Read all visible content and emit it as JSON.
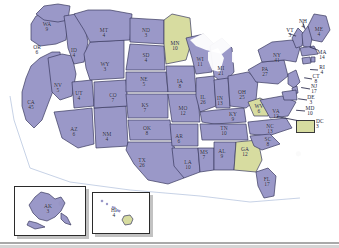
{
  "map": {
    "title": "United States Electoral Vote Map",
    "colors": {
      "purple_state": "#9a98c8",
      "green_state": "#d7dca0",
      "water": "#ffffff",
      "border": "#3a3a5e",
      "label_text": "#1d1d38",
      "coast_outline": "#b9c7e0"
    },
    "legend": {
      "dc_label": "DC",
      "dc_value": "3",
      "dc_color": "#d7dca0"
    },
    "insets": [
      {
        "name": "alaska-inset",
        "label": "AK",
        "value": "3"
      },
      {
        "name": "hawaii-inset",
        "label": "HI",
        "value": "4"
      }
    ],
    "states": [
      {
        "abbr": "WA",
        "value": "9",
        "x": 47,
        "y": 27,
        "fill": "purple"
      },
      {
        "abbr": "OR",
        "value": "6",
        "x": 37,
        "y": 50,
        "fill": "purple"
      },
      {
        "abbr": "CA",
        "value": "45",
        "x": 31,
        "y": 105,
        "fill": "purple"
      },
      {
        "abbr": "NV",
        "value": "5",
        "x": 58,
        "y": 88,
        "fill": "purple"
      },
      {
        "abbr": "ID",
        "value": "4",
        "x": 74,
        "y": 53,
        "fill": "purple"
      },
      {
        "abbr": "MT",
        "value": "4",
        "x": 104,
        "y": 33,
        "fill": "purple"
      },
      {
        "abbr": "WY",
        "value": "3",
        "x": 105,
        "y": 67,
        "fill": "purple"
      },
      {
        "abbr": "UT",
        "value": "4",
        "x": 79,
        "y": 96,
        "fill": "purple"
      },
      {
        "abbr": "AZ",
        "value": "6",
        "x": 74,
        "y": 132,
        "fill": "purple"
      },
      {
        "abbr": "CO",
        "value": "7",
        "x": 113,
        "y": 98,
        "fill": "purple"
      },
      {
        "abbr": "NM",
        "value": "4",
        "x": 107,
        "y": 137,
        "fill": "purple"
      },
      {
        "abbr": "ND",
        "value": "3",
        "x": 146,
        "y": 33,
        "fill": "purple"
      },
      {
        "abbr": "SD",
        "value": "4",
        "x": 146,
        "y": 58,
        "fill": "purple"
      },
      {
        "abbr": "NE",
        "value": "5",
        "x": 144,
        "y": 82,
        "fill": "purple"
      },
      {
        "abbr": "KS",
        "value": "7",
        "x": 145,
        "y": 108,
        "fill": "purple"
      },
      {
        "abbr": "OK",
        "value": "8",
        "x": 147,
        "y": 131,
        "fill": "purple"
      },
      {
        "abbr": "TX",
        "value": "26",
        "x": 142,
        "y": 163,
        "fill": "purple"
      },
      {
        "abbr": "MN",
        "value": "10",
        "x": 175,
        "y": 46,
        "fill": "green"
      },
      {
        "abbr": "IA",
        "value": "8",
        "x": 180,
        "y": 84,
        "fill": "purple"
      },
      {
        "abbr": "MO",
        "value": "12",
        "x": 183,
        "y": 111,
        "fill": "purple"
      },
      {
        "abbr": "AR",
        "value": "6",
        "x": 179,
        "y": 139,
        "fill": "purple"
      },
      {
        "abbr": "LA",
        "value": "10",
        "x": 188,
        "y": 165,
        "fill": "purple"
      },
      {
        "abbr": "WI",
        "value": "11",
        "x": 200,
        "y": 62,
        "fill": "purple"
      },
      {
        "abbr": "IL",
        "value": "26",
        "x": 203,
        "y": 100,
        "fill": "purple"
      },
      {
        "abbr": "MS",
        "value": "7",
        "x": 204,
        "y": 155,
        "fill": "purple"
      },
      {
        "abbr": "MI",
        "value": "21",
        "x": 221,
        "y": 71,
        "fill": "purple"
      },
      {
        "abbr": "IN",
        "value": "13",
        "x": 220,
        "y": 101,
        "fill": "purple"
      },
      {
        "abbr": "KY",
        "value": "9",
        "x": 233,
        "y": 117,
        "fill": "purple"
      },
      {
        "abbr": "TN",
        "value": "10",
        "x": 224,
        "y": 131,
        "fill": "purple"
      },
      {
        "abbr": "AL",
        "value": "9",
        "x": 222,
        "y": 154,
        "fill": "purple"
      },
      {
        "abbr": "OH",
        "value": "25",
        "x": 242,
        "y": 95,
        "fill": "purple"
      },
      {
        "abbr": "GA",
        "value": "12",
        "x": 245,
        "y": 152,
        "fill": "green"
      },
      {
        "abbr": "FL",
        "value": "17",
        "x": 267,
        "y": 182,
        "fill": "purple"
      },
      {
        "abbr": "WV",
        "value": "6",
        "x": 259,
        "y": 109,
        "fill": "green"
      },
      {
        "abbr": "VA",
        "value": "12",
        "x": 276,
        "y": 114,
        "fill": "purple"
      },
      {
        "abbr": "NC",
        "value": "13",
        "x": 270,
        "y": 129,
        "fill": "purple"
      },
      {
        "abbr": "SC",
        "value": "8",
        "x": 268,
        "y": 142,
        "fill": "purple"
      },
      {
        "abbr": "PA",
        "value": "27",
        "x": 265,
        "y": 72,
        "fill": "purple"
      },
      {
        "abbr": "NY",
        "value": "41",
        "x": 277,
        "y": 58,
        "fill": "purple"
      },
      {
        "abbr": "VT",
        "value": "3",
        "x": 290,
        "y": 33,
        "fill": "purple"
      },
      {
        "abbr": "NH",
        "value": "4",
        "x": 303,
        "y": 24,
        "fill": "purple"
      },
      {
        "abbr": "ME",
        "value": "4",
        "x": 319,
        "y": 32,
        "fill": "purple"
      },
      {
        "abbr": "MA",
        "value": "14",
        "x": 322,
        "y": 55,
        "fill": "purple"
      },
      {
        "abbr": "RI",
        "value": "4",
        "x": 322,
        "y": 70,
        "fill": "purple"
      },
      {
        "abbr": "CT",
        "value": "8",
        "x": 316,
        "y": 79,
        "fill": "purple"
      },
      {
        "abbr": "NJ",
        "value": "17",
        "x": 314,
        "y": 89,
        "fill": "purple"
      },
      {
        "abbr": "DE",
        "value": "3",
        "x": 311,
        "y": 100,
        "fill": "purple"
      },
      {
        "abbr": "MD",
        "value": "10",
        "x": 310,
        "y": 111,
        "fill": "purple"
      }
    ]
  }
}
